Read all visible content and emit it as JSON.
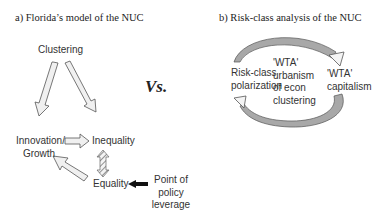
{
  "panel_a": {
    "title": "a)  Florida’s model of the NUC",
    "nodes": {
      "clustering": "Clustering",
      "innovation_line1": "Innovation/",
      "innovation_line2": "Growth",
      "inequality": "Inequality",
      "equality": "Equality",
      "leverage_line1": "Point of",
      "leverage_line2": "policy",
      "leverage_line3": "leverage"
    }
  },
  "separator": {
    "vs": "Vs."
  },
  "panel_b": {
    "title": "b) Risk-class analysis of the NUC",
    "nodes": {
      "risk_line1": "Risk-class",
      "risk_line2": "polarization",
      "center_line1": "'WTA'",
      "center_line2": "urbanism",
      "center_line3": "of econ",
      "center_line4": "clustering",
      "capitalism_line1": "'WTA'",
      "capitalism_line2": "capitalism"
    }
  },
  "colors": {
    "arrow_fill": "#f0f0f0",
    "arrow_stroke": "#555555",
    "dark_arrow": "#111111",
    "arc_fill": "#a8a8a8"
  }
}
